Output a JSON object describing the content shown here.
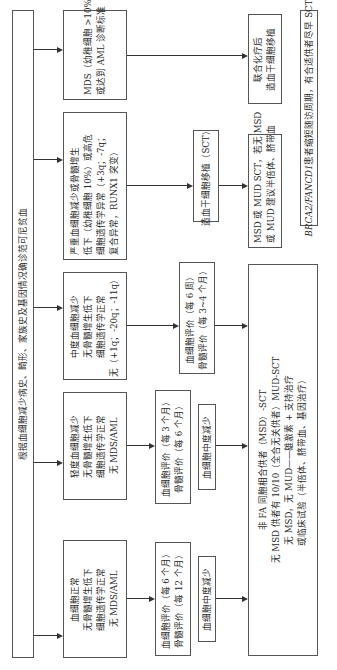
{
  "diagram": {
    "orientation": "rotated-90-ccw",
    "root": {
      "text": "根据血细胞减少病史、畸形、家族史及基因情况确诊范可尼贫血"
    },
    "categories": [
      {
        "id": "normal",
        "lines": [
          "血细胞正常",
          "无骨髓增生低下",
          "细胞遗传学正常",
          "无 MDS/AML"
        ]
      },
      {
        "id": "mild",
        "lines": [
          "轻度血细胞减少",
          "无骨髓增生低下",
          "细胞遗传学正常",
          "无 MDS/AML"
        ]
      },
      {
        "id": "moderate",
        "lines": [
          "中度血细胞减少",
          "无骨髓增生低下",
          "细胞遗传学正常",
          "无（+1q；-20q；-11q）"
        ]
      },
      {
        "id": "severe",
        "lines": [
          "严重血细胞减少或骨髓增生",
          "低下（幼稚细胞 10%）或高危",
          "细胞遗传学异常（+3q；-7q；",
          "复合异常，RUNX1 突变）"
        ]
      },
      {
        "id": "mds-aml",
        "lines": [
          "MDS（幼稚细胞 >10%）",
          "或达到 AML 诊断标准"
        ]
      }
    ],
    "monitoring": [
      {
        "id": "normal-monitor",
        "lines": [
          "血细胞评价（每 6 个月）",
          "骨髓评价（每 12 个月）"
        ]
      },
      {
        "id": "mild-monitor",
        "lines": [
          "血细胞评价（每 3 个月）",
          "骨髓评价（每 6 个月）"
        ]
      },
      {
        "id": "moderate-monitor",
        "lines": [
          "血细胞评价（每 6 周）",
          "骨髓评价（每 3~4 个月）"
        ]
      }
    ],
    "progression": [
      {
        "id": "normal-progress",
        "text": "血细胞中度减少"
      },
      {
        "id": "mild-progress",
        "text": "血细胞中度减少"
      }
    ],
    "sct_box": {
      "text": "造血干细胞移植（SCT）"
    },
    "outcomes": [
      {
        "id": "non-fa-msd",
        "lines": [
          "非 FA 同胞相合供者（MSD）-SCT",
          "无 MSD 供者有 10/10（全合无关供者）MUD-SCT",
          "无 MSD，无 MUD——雄激素 + 支持治疗",
          "或临床试验（半倍体、脐带血、基因治疗）"
        ]
      },
      {
        "id": "msd-mud",
        "lines": [
          "MSD 或 MUD SCT，若无 MSD",
          "或 MUD 建议半倍体、脐带血"
        ]
      },
      {
        "id": "chemo-sct",
        "lines": [
          "联合化疗后",
          "造血干细胞移植"
        ]
      }
    ],
    "note": {
      "italic_part": "BRCA2/FANCD1",
      "rest": " 患者缩短随访周期，有合适供者尽早 SCT"
    },
    "colors": {
      "border": "#555555",
      "line": "#333333",
      "text": "#2a2a2a",
      "background": "#ffffff"
    }
  }
}
